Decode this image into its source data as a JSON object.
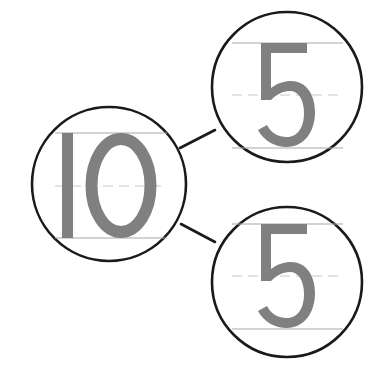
{
  "diagram": {
    "type": "number-bond",
    "whole": {
      "value": "10",
      "label": "whole"
    },
    "parts": [
      {
        "value": "5",
        "label": "part-top"
      },
      {
        "value": "5",
        "label": "part-bottom"
      }
    ],
    "colors": {
      "circle_stroke": "#1a1a1a",
      "digit_fill": "#808080",
      "guide_line": "#a8a8a8",
      "guide_dash": "#c8c8c8",
      "background": "#ffffff"
    }
  }
}
